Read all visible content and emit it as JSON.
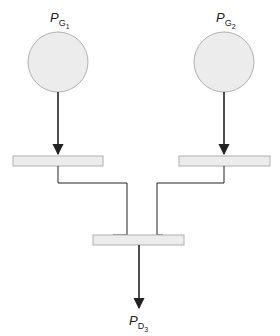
{
  "diagram": {
    "type": "power-system-one-line",
    "colors": {
      "node_fill": "#ececec",
      "node_stroke": "#b0b0b0",
      "line": "#222222",
      "bus_fill": "#ececec"
    },
    "generators": [
      {
        "id": "G1",
        "label_main": "P",
        "label_sub": "G",
        "label_subsub": "1"
      },
      {
        "id": "G2",
        "label_main": "P",
        "label_sub": "G",
        "label_subsub": "2"
      }
    ],
    "buses": [
      {
        "id": "bus1"
      },
      {
        "id": "bus2"
      },
      {
        "id": "bus3"
      }
    ],
    "load": {
      "id": "D3",
      "label_main": "P",
      "label_sub": "D",
      "label_subsub": "3"
    },
    "connections": [
      {
        "from": "G1",
        "to": "bus1",
        "arrow": true
      },
      {
        "from": "G2",
        "to": "bus2",
        "arrow": true
      },
      {
        "from": "bus1",
        "to": "bus3",
        "arrow": false
      },
      {
        "from": "bus2",
        "to": "bus3",
        "arrow": false
      },
      {
        "from": "bus3",
        "to": "D3",
        "arrow": true
      }
    ]
  }
}
